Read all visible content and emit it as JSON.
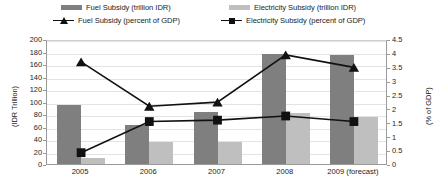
{
  "legend": {
    "items": [
      {
        "id": "fuel-bar",
        "label": "Fuel Subsidy (trillion IDR)",
        "marker": "swatch",
        "color": "#7f7f7f"
      },
      {
        "id": "elec-bar",
        "label": "Electricity Subsidy (trillion IDR)",
        "marker": "swatch",
        "color": "#bfbfbf"
      },
      {
        "id": "fuel-line",
        "label": "Fuel Subsidy (percent of GDP)",
        "marker": "line-triangle",
        "color": "#111111"
      },
      {
        "id": "elec-line",
        "label": "Electricity Subsidy (percent of GDP)",
        "marker": "line-square",
        "color": "#111111"
      }
    ]
  },
  "axes": {
    "left_title": "(IDR Trillion)",
    "right_title": "(% of GDP)",
    "left_ticks": [
      "200",
      "180",
      "160",
      "140",
      "120",
      "100",
      "80",
      "60",
      "40",
      "20",
      "0"
    ],
    "right_ticks": [
      "4.5",
      "4",
      "3.5",
      "3",
      "2.5",
      "2",
      "1.5",
      "1",
      "0.5",
      "0"
    ]
  },
  "chart_data": {
    "type": "bar",
    "title": "",
    "xlabel": "",
    "ylabel": "(IDR Trillion)",
    "y2label": "(% of GDP)",
    "ylim": [
      0,
      200
    ],
    "y2lim": [
      0,
      4.5
    ],
    "grid": true,
    "legend_position": "top",
    "categories": [
      "2005",
      "2006",
      "2007",
      "2008",
      "2009 (forecast)"
    ],
    "series": [
      {
        "name": "Fuel Subsidy (trillion IDR)",
        "type": "bar",
        "axis": "left",
        "color": "#7f7f7f",
        "values": [
          95,
          62,
          83,
          176,
          174
        ]
      },
      {
        "name": "Electricity Subsidy (trillion IDR)",
        "type": "bar",
        "axis": "left",
        "color": "#bfbfbf",
        "values": [
          10,
          35,
          35,
          82,
          75
        ]
      },
      {
        "name": "Fuel Subsidy (percent of GDP)",
        "type": "line",
        "axis": "right",
        "color": "#111111",
        "marker": "triangle",
        "values": [
          3.75,
          2.15,
          2.3,
          4.0,
          3.55
        ]
      },
      {
        "name": "Electricity Subsidy (percent of GDP)",
        "type": "line",
        "axis": "right",
        "color": "#111111",
        "marker": "square",
        "values": [
          0.48,
          1.6,
          1.65,
          1.8,
          1.6
        ]
      }
    ]
  }
}
